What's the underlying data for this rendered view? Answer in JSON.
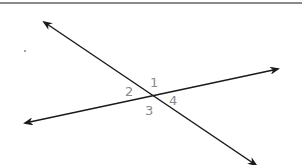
{
  "diagram": {
    "type": "intersecting-lines",
    "line_color": "#1a1a1a",
    "label_color": "#8a8a8a",
    "rule_color": "#8a8a8a",
    "intersection": {
      "x": 151,
      "y": 96
    },
    "lines": [
      {
        "name": "line-steep",
        "x1": 44,
        "y1": 22,
        "x2": 256,
        "y2": 165,
        "arrow_start": true,
        "arrow_end": true
      },
      {
        "name": "line-shallow",
        "x1": 25,
        "y1": 123,
        "x2": 278,
        "y2": 69,
        "arrow_start": true,
        "arrow_end": true
      }
    ],
    "angle_labels": [
      {
        "text": "1",
        "x": 150,
        "y": 87
      },
      {
        "text": "2",
        "x": 125,
        "y": 96
      },
      {
        "text": "3",
        "x": 145,
        "y": 115
      },
      {
        "text": "4",
        "x": 169,
        "y": 105
      }
    ]
  }
}
